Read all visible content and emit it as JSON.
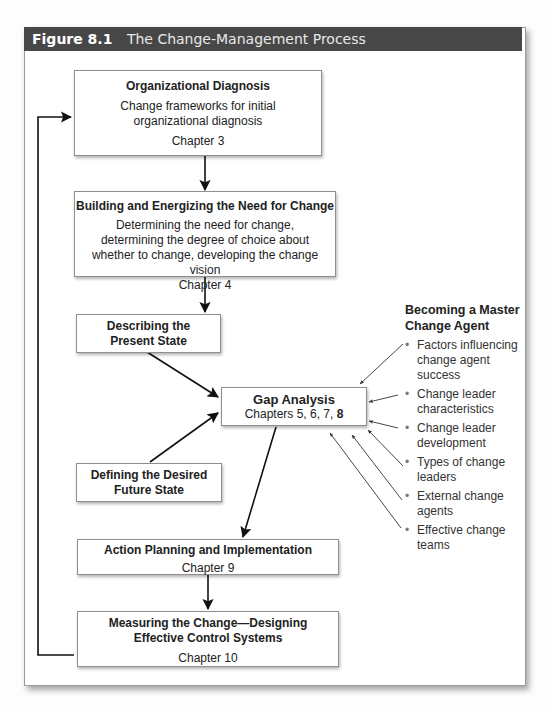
{
  "figure": {
    "number": "Figure 8.1",
    "title": "The Change-Management Process"
  },
  "boxes": {
    "diagnosis": {
      "title": "Organizational Diagnosis",
      "desc": "Change frameworks for initial organizational diagnosis",
      "chapter": "Chapter 3"
    },
    "need": {
      "title": "Building and Energizing the Need for Change",
      "desc": "Determining the need for change, determining the degree of choice about whether to change, developing the change vision",
      "chapter": "Chapter 4"
    },
    "present": {
      "title": "Describing the Present State"
    },
    "gap": {
      "title": "Gap Analysis",
      "chapters_prefix": "Chapters 5, 6, 7, ",
      "chapters_bold": "8"
    },
    "future": {
      "title": "Defining the Desired Future State"
    },
    "action": {
      "title": "Action Planning and Implementation",
      "chapter": "Chapter 9"
    },
    "measure": {
      "title": "Measuring the Change—Designing Effective Control Systems",
      "chapter": "Chapter 10"
    }
  },
  "side_panel": {
    "title": "Becoming a Master Change Agent",
    "items": [
      "Factors influencing change agent success",
      "Change leader characteristics",
      "Change leader development",
      "Types of change leaders",
      "External change agents",
      "Effective change teams"
    ]
  },
  "colors": {
    "header_bg": "#474747",
    "header_text": "#ffffff",
    "box_border": "#8f8f8f",
    "arrow": "#111111"
  }
}
